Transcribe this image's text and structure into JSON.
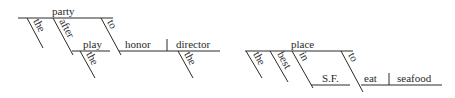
{
  "diagrams": [
    {
      "sentence": "the party after the play to honor the director",
      "words": {
        "subject": "party",
        "mod_the": "the",
        "prep_after": "after",
        "obj_play": "play",
        "play_the": "the",
        "inf_to": "to",
        "verb_honor": "honor",
        "obj_director": "director",
        "director_the": "the"
      }
    },
    {
      "sentence": "the best place in S.F. to eat seafood",
      "words": {
        "subject": "place",
        "mod_the": "the",
        "mod_best": "best",
        "prep_in": "in",
        "obj_sf": "S.F.",
        "inf_to": "to",
        "verb_eat": "eat",
        "obj_seafood": "seafood"
      }
    }
  ],
  "colors": {
    "ink": "#2a2a2a",
    "background": "#ffffff"
  }
}
